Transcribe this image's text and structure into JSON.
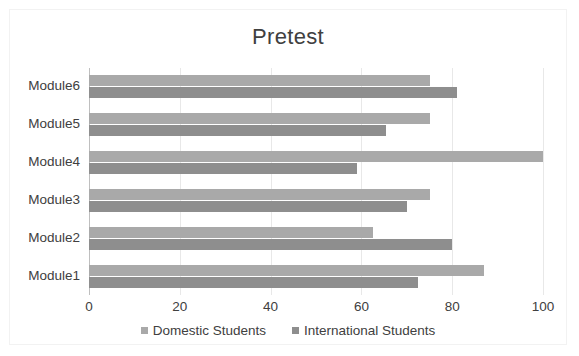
{
  "chart_data": {
    "type": "bar",
    "orientation": "horizontal",
    "title": "Pretest",
    "xlabel": "",
    "ylabel": "",
    "categories": [
      "Module1",
      "Module2",
      "Module3",
      "Module4",
      "Module5",
      "Module6"
    ],
    "series": [
      {
        "name": "Domestic Students",
        "color": "#a9a9a9",
        "values": [
          87,
          62.5,
          75,
          100,
          75,
          75
        ]
      },
      {
        "name": "International Students",
        "color": "#8e8e8e",
        "values": [
          72.5,
          80,
          70,
          59,
          65.5,
          81
        ]
      }
    ],
    "xlim": [
      0,
      100
    ],
    "xticks": [
      0,
      20,
      40,
      60,
      80,
      100
    ],
    "xtick_labels": [
      "0",
      "20",
      "40",
      "60",
      "80",
      "100"
    ],
    "grid": true,
    "grid_axis": "x",
    "legend_position": "bottom"
  },
  "legend": {
    "items": [
      {
        "label": "Domestic Students",
        "color": "#a9a9a9"
      },
      {
        "label": "International Students",
        "color": "#8e8e8e"
      }
    ]
  },
  "colors": {
    "domestic": "#a9a9a9",
    "international": "#8e8e8e",
    "text": "#404040",
    "gridline": "#e8e8e8",
    "axis": "#bfbfbf",
    "frame": "#f2f2f2",
    "background": "#ffffff"
  }
}
